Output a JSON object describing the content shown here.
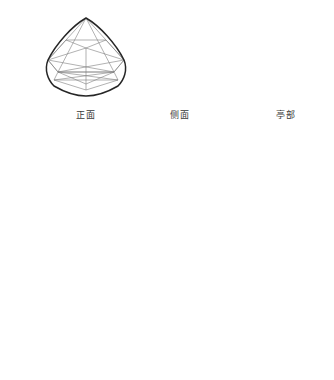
{
  "page": {
    "background_color": "#ffffff",
    "width": 334,
    "height": 380
  },
  "style": {
    "outline_color": "#2a2a2a",
    "facet_color": "#6b6b6b",
    "light_facet_color": "#8f8f8f",
    "guide_color": "#c9c9c9",
    "dashed_color": "#7a7a7a",
    "label_color": "#3a3a3a"
  },
  "views": {
    "front": {
      "label": "正面",
      "name": "front-view",
      "center_x": 86,
      "center_y": 58
    },
    "side": {
      "label": "侧面",
      "name": "side-view",
      "center_x": 180,
      "center_y": 62
    },
    "pavilion": {
      "label": "亭部",
      "name": "pavilion-view",
      "center_x": 286,
      "center_y": 58
    }
  },
  "steps": [
    {
      "index": 1,
      "name": "step-outline",
      "description": "轮廓",
      "center_x": 66,
      "center_y": 218,
      "has_guides": false,
      "has_dashed": false,
      "has_facets": false
    },
    {
      "index": 2,
      "name": "step-guides",
      "description": "辅助线",
      "center_x": 175,
      "center_y": 218,
      "has_guides": true,
      "has_dashed": false,
      "has_facets": false
    },
    {
      "index": 3,
      "name": "step-girdle",
      "description": "腰棱与台面",
      "center_x": 287,
      "center_y": 218,
      "has_guides": true,
      "has_dashed": true,
      "has_facets": false
    },
    {
      "index": 4,
      "name": "step-facets-guides",
      "description": "刻面分割",
      "center_x": 125,
      "center_y": 340,
      "has_guides": true,
      "has_dashed": true,
      "has_facets": true
    },
    {
      "index": 5,
      "name": "step-final",
      "description": "完成",
      "center_x": 235,
      "center_y": 340,
      "has_guides": false,
      "has_dashed": false,
      "has_facets": true
    }
  ]
}
